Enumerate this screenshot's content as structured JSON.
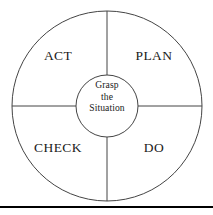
{
  "diagram": {
    "type": "cycle-wheel",
    "background_color": "#ffffff",
    "stroke_color": "#444444",
    "text_color": "#1a1a1a",
    "rule_color": "#000000",
    "geometry": {
      "center_x": 107,
      "center_y": 106,
      "outer_radius": 95,
      "inner_radius": 31
    },
    "quadrants": [
      {
        "id": "act",
        "label": "ACT",
        "position": "top-left"
      },
      {
        "id": "plan",
        "label": "PLAN",
        "position": "top-right"
      },
      {
        "id": "check",
        "label": "CHECK",
        "position": "bottom-left"
      },
      {
        "id": "do",
        "label": "DO",
        "position": "bottom-right"
      }
    ],
    "hub": {
      "lines": [
        "Grasp",
        "the",
        "Situation"
      ]
    }
  }
}
